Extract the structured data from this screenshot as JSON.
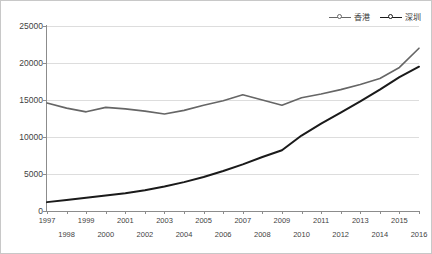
{
  "chart_data": {
    "type": "line",
    "title": "",
    "subtitle": "",
    "xlabel": "",
    "ylabel": "",
    "x": [
      1997,
      1998,
      1999,
      2000,
      2001,
      2002,
      2003,
      2004,
      2005,
      2006,
      2007,
      2008,
      2009,
      2010,
      2011,
      2012,
      2013,
      2014,
      2015,
      2016
    ],
    "categories": [
      "1997",
      "1998",
      "1999",
      "2000",
      "2001",
      "2002",
      "2003",
      "2004",
      "2005",
      "2006",
      "2007",
      "2008",
      "2009",
      "2010",
      "2011",
      "2012",
      "2013",
      "2014",
      "2015",
      "2016"
    ],
    "series": [
      {
        "name": "香港",
        "color": "#666666",
        "marker": "hollow-circle",
        "values": [
          14600,
          13900,
          13400,
          14000,
          13800,
          13500,
          13100,
          13600,
          14300,
          14900,
          15700,
          15000,
          14300,
          15300,
          15800,
          16400,
          17100,
          17900,
          19400,
          22000
        ]
      },
      {
        "name": "深圳",
        "color": "#1a1a1a",
        "marker": "filled-circle",
        "values": [
          1200,
          1500,
          1800,
          2100,
          2400,
          2800,
          3300,
          3900,
          4600,
          5400,
          6300,
          7300,
          8200,
          10200,
          11800,
          13300,
          14800,
          16400,
          18100,
          19500
        ]
      }
    ],
    "ylim": [
      0,
      25000
    ],
    "ytick_values": [
      0,
      5000,
      10000,
      15000,
      20000,
      25000
    ],
    "ytick_labels": [
      "0",
      "5000",
      "10000",
      "15000",
      "20000",
      "25000"
    ],
    "grid": true,
    "grid_axis": "y",
    "legend_position": "top-right",
    "xaxis_label_rows": {
      "top": [
        "1997",
        "1999",
        "2001",
        "2003",
        "2005",
        "2007",
        "2009",
        "2011",
        "2013",
        "2015"
      ],
      "bottom": [
        "1998",
        "2000",
        "2002",
        "2004",
        "2006",
        "2008",
        "2010",
        "2012",
        "2014",
        "2016"
      ]
    }
  },
  "legend": {
    "entries": [
      {
        "label": "香港",
        "color": "#666666"
      },
      {
        "label": "深圳",
        "color": "#1a1a1a"
      }
    ]
  },
  "colors": {
    "grid": "#dddddd",
    "axis": "#8c8c8c",
    "border": "#c8c8c8",
    "text": "#3f3f3f",
    "hongkong": "#666666",
    "shenzhen": "#1a1a1a"
  }
}
